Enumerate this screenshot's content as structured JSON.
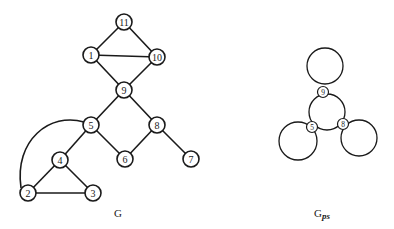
{
  "graph_g": {
    "caption": "G",
    "nodes": [
      {
        "id": "11",
        "label": "11"
      },
      {
        "id": "1",
        "label": "1"
      },
      {
        "id": "10",
        "label": "10"
      },
      {
        "id": "9",
        "label": "9"
      },
      {
        "id": "5",
        "label": "5"
      },
      {
        "id": "8",
        "label": "8"
      },
      {
        "id": "4",
        "label": "4"
      },
      {
        "id": "6",
        "label": "6"
      },
      {
        "id": "7",
        "label": "7"
      },
      {
        "id": "2",
        "label": "2"
      },
      {
        "id": "3",
        "label": "3"
      }
    ],
    "edges": [
      [
        "11",
        "1"
      ],
      [
        "11",
        "10"
      ],
      [
        "1",
        "10"
      ],
      [
        "1",
        "9"
      ],
      [
        "10",
        "9"
      ],
      [
        "9",
        "5"
      ],
      [
        "9",
        "8"
      ],
      [
        "5",
        "4"
      ],
      [
        "5",
        "6"
      ],
      [
        "8",
        "6"
      ],
      [
        "8",
        "7"
      ],
      [
        "4",
        "2"
      ],
      [
        "4",
        "3"
      ],
      [
        "2",
        "3"
      ],
      [
        "2",
        "5"
      ]
    ]
  },
  "graph_gps": {
    "caption_main": "G",
    "caption_sub": "ps",
    "nodes": [
      {
        "id": "9",
        "label": "9"
      },
      {
        "id": "5",
        "label": "5"
      },
      {
        "id": "8",
        "label": "8"
      }
    ],
    "loops": 4
  }
}
